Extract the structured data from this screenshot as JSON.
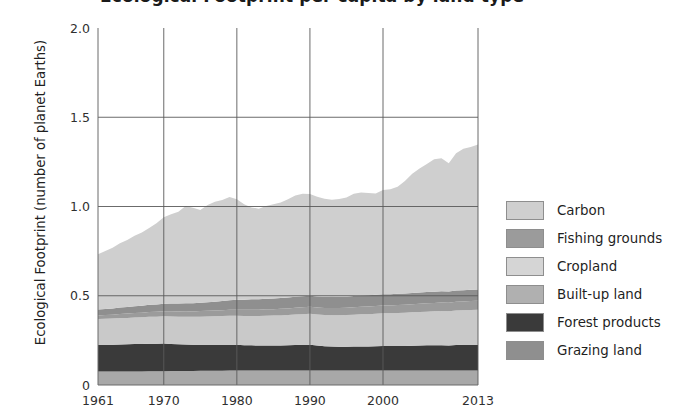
{
  "chart_data": {
    "type": "area",
    "title": "Ecological Footprint per capita by land type",
    "xlabel": "",
    "ylabel": "Ecological Footprint (number of planet Earths)",
    "xlim": [
      1961,
      2013
    ],
    "ylim": [
      0,
      2.0
    ],
    "xticks": [
      "1961",
      "1970",
      "1980",
      "1990",
      "2000",
      "2013"
    ],
    "xtick_values": [
      1961,
      1970,
      1980,
      1990,
      2000,
      2013
    ],
    "yticks": [
      "0",
      "0.5",
      "1.0",
      "1.5",
      "2.0"
    ],
    "ytick_values": [
      0,
      0.5,
      1.0,
      1.5,
      2.0
    ],
    "grid": true,
    "legend_position": "right",
    "stack_order_bottom_to_top": [
      "Cropland",
      "Forest products",
      "Built-up land",
      "Fishing grounds",
      "Grazing land",
      "Carbon"
    ],
    "x": [
      1961,
      1962,
      1963,
      1964,
      1965,
      1966,
      1967,
      1968,
      1969,
      1970,
      1971,
      1972,
      1973,
      1974,
      1975,
      1976,
      1977,
      1978,
      1979,
      1980,
      1981,
      1982,
      1983,
      1984,
      1985,
      1986,
      1987,
      1988,
      1989,
      1990,
      1991,
      1992,
      1993,
      1994,
      1995,
      1996,
      1997,
      1998,
      1999,
      2000,
      2001,
      2002,
      2003,
      2004,
      2005,
      2006,
      2007,
      2008,
      2009,
      2010,
      2011,
      2012,
      2013
    ],
    "series": [
      {
        "name": "Cropland",
        "color": "#a8a8a8",
        "values": [
          0.075,
          0.075,
          0.075,
          0.075,
          0.076,
          0.076,
          0.076,
          0.077,
          0.077,
          0.077,
          0.078,
          0.078,
          0.079,
          0.079,
          0.08,
          0.08,
          0.08,
          0.08,
          0.081,
          0.081,
          0.081,
          0.081,
          0.081,
          0.081,
          0.081,
          0.081,
          0.081,
          0.081,
          0.081,
          0.081,
          0.081,
          0.081,
          0.081,
          0.081,
          0.081,
          0.081,
          0.081,
          0.081,
          0.081,
          0.081,
          0.081,
          0.081,
          0.081,
          0.081,
          0.081,
          0.081,
          0.081,
          0.081,
          0.081,
          0.081,
          0.081,
          0.081,
          0.081
        ]
      },
      {
        "name": "Forest products",
        "color": "#3a3a3a",
        "values": [
          0.15,
          0.15,
          0.15,
          0.152,
          0.152,
          0.153,
          0.153,
          0.154,
          0.154,
          0.155,
          0.152,
          0.15,
          0.148,
          0.146,
          0.145,
          0.145,
          0.145,
          0.145,
          0.145,
          0.144,
          0.142,
          0.141,
          0.14,
          0.14,
          0.14,
          0.14,
          0.141,
          0.143,
          0.144,
          0.145,
          0.14,
          0.136,
          0.134,
          0.133,
          0.133,
          0.134,
          0.135,
          0.135,
          0.136,
          0.138,
          0.137,
          0.137,
          0.138,
          0.139,
          0.14,
          0.141,
          0.142,
          0.142,
          0.14,
          0.143,
          0.144,
          0.144,
          0.145
        ]
      },
      {
        "name": "Built-up land",
        "color": "#c9c9c9",
        "values": [
          0.145,
          0.146,
          0.147,
          0.148,
          0.148,
          0.149,
          0.15,
          0.151,
          0.152,
          0.153,
          0.154,
          0.155,
          0.156,
          0.157,
          0.158,
          0.159,
          0.16,
          0.161,
          0.162,
          0.163,
          0.164,
          0.165,
          0.166,
          0.167,
          0.168,
          0.169,
          0.17,
          0.171,
          0.172,
          0.173,
          0.174,
          0.175,
          0.176,
          0.177,
          0.178,
          0.179,
          0.18,
          0.181,
          0.182,
          0.183,
          0.184,
          0.185,
          0.186,
          0.187,
          0.188,
          0.189,
          0.19,
          0.191,
          0.192,
          0.193,
          0.194,
          0.195,
          0.196
        ]
      },
      {
        "name": "Fishing grounds",
        "color": "#9b9b9b",
        "values": [
          0.02,
          0.021,
          0.022,
          0.023,
          0.024,
          0.025,
          0.026,
          0.027,
          0.027,
          0.028,
          0.029,
          0.029,
          0.03,
          0.03,
          0.031,
          0.032,
          0.032,
          0.033,
          0.033,
          0.034,
          0.034,
          0.035,
          0.035,
          0.036,
          0.036,
          0.037,
          0.037,
          0.038,
          0.038,
          0.039,
          0.039,
          0.04,
          0.04,
          0.041,
          0.041,
          0.042,
          0.042,
          0.043,
          0.043,
          0.044,
          0.044,
          0.045,
          0.045,
          0.046,
          0.046,
          0.047,
          0.047,
          0.048,
          0.048,
          0.049,
          0.049,
          0.05,
          0.05
        ]
      },
      {
        "name": "Grazing land",
        "color": "#8f8f8f",
        "values": [
          0.033,
          0.034,
          0.035,
          0.036,
          0.037,
          0.038,
          0.039,
          0.04,
          0.041,
          0.042,
          0.043,
          0.044,
          0.045,
          0.046,
          0.047,
          0.048,
          0.05,
          0.052,
          0.054,
          0.056,
          0.057,
          0.058,
          0.058,
          0.059,
          0.06,
          0.06,
          0.061,
          0.061,
          0.062,
          0.062,
          0.062,
          0.062,
          0.062,
          0.062,
          0.062,
          0.063,
          0.063,
          0.063,
          0.063,
          0.063,
          0.063,
          0.063,
          0.063,
          0.063,
          0.063,
          0.063,
          0.063,
          0.063,
          0.063,
          0.063,
          0.063,
          0.063,
          0.063
        ]
      },
      {
        "name": "Carbon",
        "color": "#cfcfcf",
        "values": [
          0.31,
          0.325,
          0.34,
          0.36,
          0.375,
          0.395,
          0.41,
          0.43,
          0.455,
          0.485,
          0.5,
          0.515,
          0.545,
          0.535,
          0.52,
          0.545,
          0.56,
          0.565,
          0.578,
          0.562,
          0.535,
          0.515,
          0.508,
          0.52,
          0.527,
          0.535,
          0.55,
          0.568,
          0.575,
          0.57,
          0.558,
          0.55,
          0.545,
          0.548,
          0.556,
          0.572,
          0.578,
          0.572,
          0.568,
          0.583,
          0.588,
          0.6,
          0.63,
          0.667,
          0.695,
          0.717,
          0.742,
          0.746,
          0.718,
          0.77,
          0.793,
          0.8,
          0.812
        ]
      }
    ],
    "totals_note": {
      "1961": 0.733,
      "1980": 1.04,
      "1990": 1.07,
      "2000": 1.092,
      "2013": 1.347
    }
  },
  "legend": {
    "items": [
      {
        "label": "Carbon",
        "color": "#cfcfcf"
      },
      {
        "label": "Fishing grounds",
        "color": "#9b9b9b"
      },
      {
        "label": "Cropland",
        "color": "#d5d5d5"
      },
      {
        "label": "Built-up land",
        "color": "#b0b0b0"
      },
      {
        "label": "Forest products",
        "color": "#3a3a3a"
      },
      {
        "label": "Grazing land",
        "color": "#8f8f8f"
      }
    ]
  },
  "axes": {
    "y_title": "Ecological Footprint (number of planet Earths)",
    "x_tick_labels": [
      "1961",
      "1970",
      "1980",
      "1990",
      "2000",
      "2013"
    ],
    "y_tick_labels": [
      "0",
      "0.5",
      "1.0",
      "1.5",
      "2.0"
    ]
  },
  "title": "Ecological Footprint per capita by land type"
}
